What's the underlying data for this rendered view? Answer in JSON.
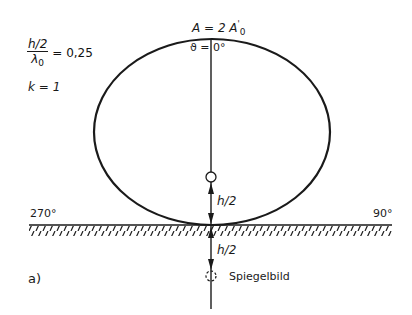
{
  "figure": {
    "panel_label": "a)",
    "params": {
      "fraction_numerator": "h/2",
      "fraction_denominator": "λ",
      "fraction_denominator_sub": "0",
      "fraction_value": "= 0,25",
      "k_label": "k = 1"
    },
    "top_label": {
      "amplitude_prefix": "A = 2 A",
      "amplitude_sub": "0",
      "amplitude_prime": "'",
      "angle": "ϑ = 0°"
    },
    "angles": {
      "left": "270°",
      "right": "90°"
    },
    "height_labels": {
      "upper": "h/2",
      "lower": "h/2"
    },
    "mirror_label": "Spiegelbild",
    "colors": {
      "ink": "#1a1a1a",
      "background": "#ffffff"
    }
  }
}
